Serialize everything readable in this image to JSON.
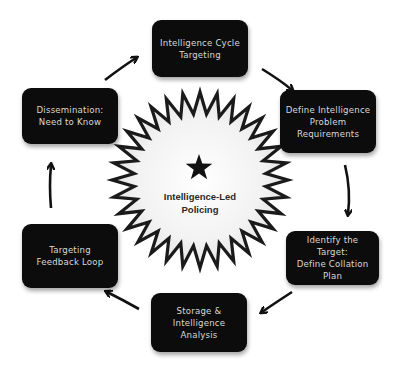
{
  "center": {
    "label": "Intelligence-Led\nPolicing",
    "icon": "star-icon"
  },
  "steps": [
    {
      "label": "Intelligence Cycle\nTargeting"
    },
    {
      "label": "Define Intelligence\nProblem\nRequirements"
    },
    {
      "label": "Identify the Target:\nDefine Collation\nPlan"
    },
    {
      "label": "Storage &\nIntelligence\nAnalysis"
    },
    {
      "label": "Targeting\nFeedback Loop"
    },
    {
      "label": "Dissemination:\nNeed to Know"
    }
  ],
  "colors": {
    "box_fill": "#0c0c0c",
    "box_text": "#d8d8d8",
    "arrow": "#111111",
    "starburst_stroke": "#1a1a1a"
  }
}
